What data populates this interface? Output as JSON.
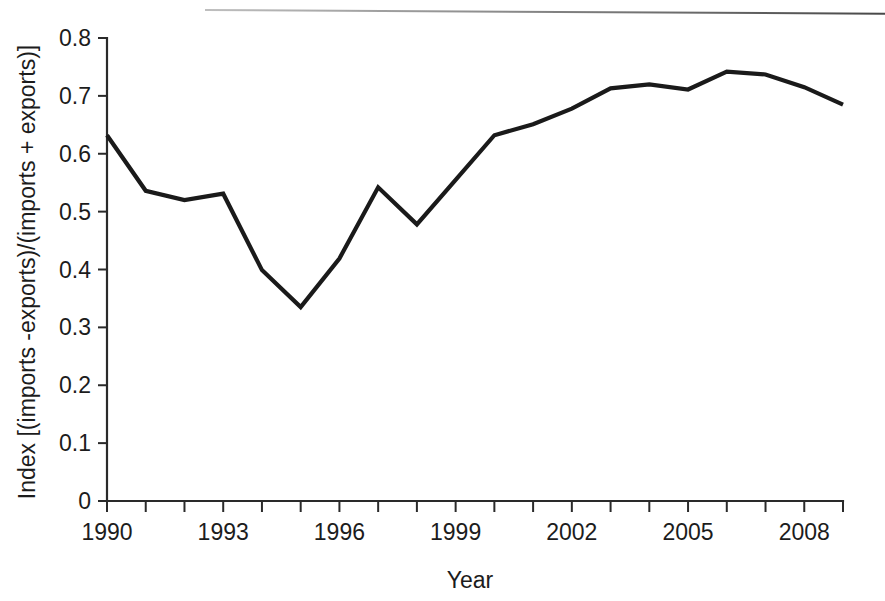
{
  "chart_data": {
    "type": "line",
    "title": "",
    "xlabel": "Year",
    "ylabel": "Index [(imports -exports)/(imports + exports)]",
    "xlim": [
      1990,
      2009
    ],
    "ylim": [
      0,
      0.8
    ],
    "grid": false,
    "legend": "none",
    "line_color": "#1a1a1a",
    "x": [
      1990,
      1991,
      1992,
      1993,
      1994,
      1995,
      1996,
      1997,
      1998,
      1999,
      2000,
      2001,
      2002,
      2003,
      2004,
      2005,
      2006,
      2007,
      2008,
      2009
    ],
    "values": [
      0.632,
      0.536,
      0.52,
      0.531,
      0.399,
      0.335,
      0.419,
      0.542,
      0.478,
      0.555,
      0.632,
      0.651,
      0.678,
      0.713,
      0.72,
      0.711,
      0.742,
      0.737,
      0.715,
      0.685
    ],
    "series": [
      {
        "name": "Index",
        "values": [
          0.632,
          0.536,
          0.52,
          0.531,
          0.399,
          0.335,
          0.419,
          0.542,
          0.478,
          0.555,
          0.632,
          0.651,
          0.678,
          0.713,
          0.72,
          0.711,
          0.742,
          0.737,
          0.715,
          0.685
        ]
      }
    ],
    "categories": [
      "1990",
      "1991",
      "1992",
      "1993",
      "1994",
      "1995",
      "1996",
      "1997",
      "1998",
      "1999",
      "2000",
      "2001",
      "2002",
      "2003",
      "2004",
      "2005",
      "2006",
      "2007",
      "2008",
      "2009"
    ],
    "x_tick_labels": [
      "1990",
      "1993",
      "1996",
      "1999",
      "2002",
      "2005",
      "2008"
    ],
    "x_tick_values": [
      1990,
      1993,
      1996,
      1999,
      2002,
      2005,
      2008
    ],
    "x_minor_ticks": [
      1990,
      1991,
      1992,
      1993,
      1994,
      1995,
      1996,
      1997,
      1998,
      1999,
      2000,
      2001,
      2002,
      2003,
      2004,
      2005,
      2006,
      2007,
      2008,
      2009
    ],
    "y_tick_labels": [
      "0",
      "0.1",
      "0.2",
      "0.3",
      "0.4",
      "0.5",
      "0.6",
      "0.7",
      "0.8"
    ],
    "y_tick_values": [
      0,
      0.1,
      0.2,
      0.3,
      0.4,
      0.5,
      0.6,
      0.7,
      0.8
    ]
  }
}
